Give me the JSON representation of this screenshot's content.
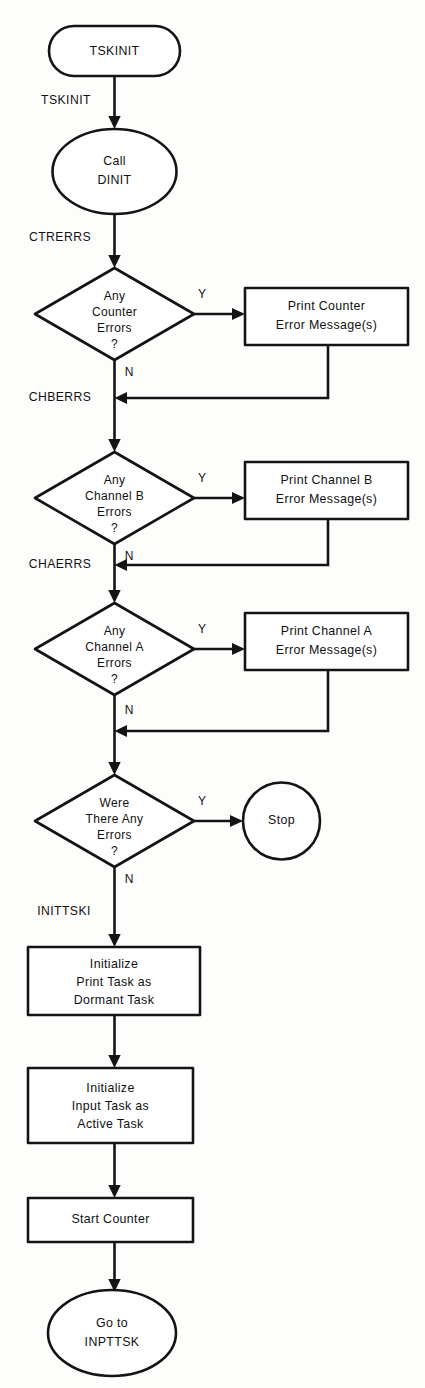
{
  "diagram": {
    "colors": {
      "stroke": "#141414",
      "fill": "#ffffff",
      "background": "#fdfdfc",
      "text": "#111111"
    },
    "nodes": {
      "start": {
        "label": "TSKINIT",
        "shape": "rounded-rectangle"
      },
      "call_dinit": {
        "line1": "Call",
        "line2": "DINIT",
        "shape": "ellipse"
      },
      "decision_counter": {
        "line1": "Any",
        "line2": "Counter",
        "line3": "Errors",
        "line4": "?",
        "shape": "diamond"
      },
      "print_counter": {
        "line1": "Print Counter",
        "line2": "Error Message(s)",
        "shape": "rectangle"
      },
      "decision_channel_b": {
        "line1": "Any",
        "line2": "Channel B",
        "line3": "Errors",
        "line4": "?",
        "shape": "diamond"
      },
      "print_channel_b": {
        "line1": "Print Channel B",
        "line2": "Error Message(s)",
        "shape": "rectangle"
      },
      "decision_channel_a": {
        "line1": "Any",
        "line2": "Channel A",
        "line3": "Errors",
        "line4": "?",
        "shape": "diamond"
      },
      "print_channel_a": {
        "line1": "Print Channel A",
        "line2": "Error Message(s)",
        "shape": "rectangle"
      },
      "decision_any_errors": {
        "line1": "Were",
        "line2": "There Any",
        "line3": "Errors",
        "line4": "?",
        "shape": "diamond"
      },
      "stop": {
        "label": "Stop",
        "shape": "circle"
      },
      "init_print_task": {
        "line1": "Initialize",
        "line2": "Print Task as",
        "line3": "Dormant Task",
        "shape": "rectangle"
      },
      "init_input_task": {
        "line1": "Initialize",
        "line2": "Input Task as",
        "line3": "Active Task",
        "shape": "rectangle"
      },
      "start_counter": {
        "label": "Start Counter",
        "shape": "rectangle"
      },
      "goto_inpttsk": {
        "line1": "Go to",
        "line2": "INPTTSK",
        "shape": "ellipse"
      }
    },
    "edge_labels": {
      "tskinit": "TSKINIT",
      "ctrerrs": "CTRERRS",
      "chberrs": "CHBERRS",
      "chaerrs": "CHAERRS",
      "inittski": "INITTSKI"
    },
    "branch_labels": {
      "yes": "Y",
      "no": "N"
    }
  }
}
